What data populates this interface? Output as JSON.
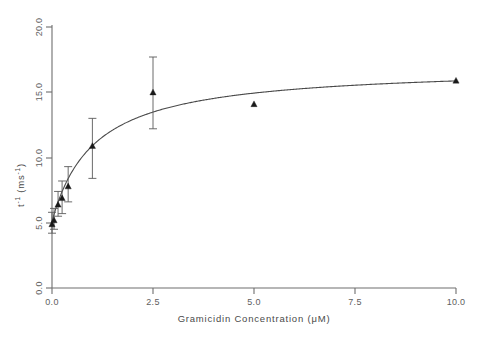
{
  "chart_data": {
    "type": "scatter",
    "title": "",
    "subtitle": "",
    "xlabel": "Gramicidin  Concentration  (μM)",
    "ylabel": "t⁻¹  (ms⁻¹)",
    "ylabel_parts": {
      "base": "t",
      "base_exp": "-1",
      "unit_open": "(ms",
      "unit_exp": "-1",
      "unit_close": ")"
    },
    "xlim": [
      0.0,
      10.0
    ],
    "ylim": [
      0.0,
      20.0
    ],
    "xticks": [
      0.0,
      2.5,
      5.0,
      7.5,
      10.0
    ],
    "xticklabels": [
      "0.0",
      "2.5",
      "5.0",
      "7.5",
      "10.0"
    ],
    "yticks": [
      0.0,
      5.0,
      10.0,
      15.0,
      20.0
    ],
    "yticklabels": [
      "0.0",
      "5.0",
      "10.0",
      "15.0",
      "20.0"
    ],
    "grid": false,
    "legend": "none",
    "marker_style": "filled-triangle",
    "error_bars": "vertical-with-caps",
    "series": [
      {
        "name": "t-inverse vs gramicidin concentration",
        "color": "#1a1a1a",
        "points": [
          {
            "x": 0.0,
            "y": 4.9,
            "yerr_low": 4.2,
            "yerr_high": 5.8
          },
          {
            "x": 0.05,
            "y": 5.2,
            "yerr_low": 4.5,
            "yerr_high": 6.1
          },
          {
            "x": 0.15,
            "y": 6.4,
            "yerr_low": 5.5,
            "yerr_high": 7.4
          },
          {
            "x": 0.25,
            "y": 6.9,
            "yerr_low": 5.7,
            "yerr_high": 8.2
          },
          {
            "x": 0.4,
            "y": 7.8,
            "yerr_low": 6.6,
            "yerr_high": 9.3
          },
          {
            "x": 1.0,
            "y": 10.9,
            "yerr_low": 8.4,
            "yerr_high": 13.0
          },
          {
            "x": 2.5,
            "y": 15.0,
            "yerr_low": 12.2,
            "yerr_high": 17.7
          },
          {
            "x": 5.0,
            "y": 14.1,
            "yerr_low": null,
            "yerr_high": null
          },
          {
            "x": 10.0,
            "y": 15.9,
            "yerr_low": null,
            "yerr_high": null
          }
        ]
      }
    ],
    "fit_curve": {
      "name": "hyperbolic saturation fit",
      "equation": "y = y0 + (Vmax * x) / (K + x)",
      "y0": 5.1,
      "Vmax": 11.9,
      "K": 1.05,
      "color": "#4a4a4a"
    }
  }
}
